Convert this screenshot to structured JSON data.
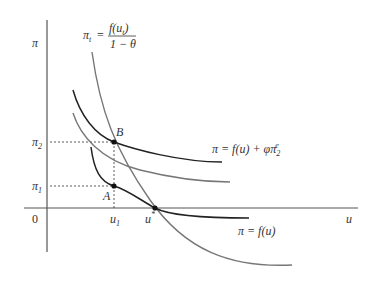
{
  "diagram": {
    "axes": {
      "y_label": "π",
      "x_label": "u",
      "origin_label": "0"
    },
    "top_formula": {
      "lhs": "π",
      "lhs_sub": "t",
      "eq": "=",
      "numerator": "f(u",
      "numerator_sub": "t",
      "numerator_end": ")",
      "denominator": "1 − θ"
    },
    "y_ticks": [
      {
        "label": "π",
        "sub": "2"
      },
      {
        "label": "π",
        "sub": "1"
      }
    ],
    "x_ticks": [
      {
        "label": "u",
        "sub": "1"
      },
      {
        "label": "u",
        "sup": "*"
      }
    ],
    "points": {
      "B": "B",
      "A": "A"
    },
    "curve_labels": {
      "upper": {
        "text": "π = f(u) + φπ",
        "sub": "2",
        "sup": "e"
      },
      "lower": {
        "text": "π = f(u)"
      }
    },
    "colors": {
      "dark_curve": "#222222",
      "gray_curve": "#777777",
      "axis": "#555555"
    }
  }
}
